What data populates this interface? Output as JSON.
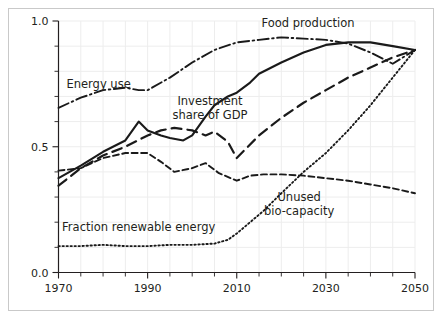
{
  "figure": {
    "background_color": "#ffffff",
    "frame_color": "#c9c9c9",
    "line_color": "#1a1a1a",
    "grid_color": "#ededed",
    "text_color": "#231f20"
  },
  "chart_data": {
    "type": "line",
    "title": "",
    "subtitle": "",
    "xlabel": "",
    "ylabel": "",
    "xlim": [
      1970,
      2050
    ],
    "ylim": [
      0.0,
      1.0
    ],
    "grid": true,
    "legend_position": "inline-annotations",
    "x_ticks_major": [
      1970,
      1990,
      2010,
      2030,
      2050
    ],
    "x_tick_labels": [
      "1970",
      "1990",
      "2010",
      "2030",
      "2050"
    ],
    "x_ticks_minor": [
      1975,
      1980,
      1985,
      1995,
      2000,
      2005,
      2015,
      2020,
      2025,
      2035,
      2040,
      2045
    ],
    "y_ticks_major": [
      0.0,
      0.5,
      1.0
    ],
    "y_tick_labels": [
      "0.0",
      "0.5",
      "1.0"
    ],
    "y_ticks_minor": [
      0.1,
      0.2,
      0.3,
      0.4,
      0.6,
      0.7,
      0.8,
      0.9
    ],
    "series": [
      {
        "name": "Food production",
        "label": "Food production",
        "style": "solid",
        "label_x": 2026,
        "label_y": 0.975,
        "x": [
          1970,
          1975,
          1980,
          1985,
          1988,
          1990,
          1993,
          1995,
          1998,
          2000,
          2003,
          2005,
          2008,
          2010,
          2013,
          2015,
          2020,
          2025,
          2030,
          2035,
          2040,
          2045,
          2050
        ],
        "values": [
          0.375,
          0.425,
          0.48,
          0.525,
          0.6,
          0.565,
          0.545,
          0.535,
          0.525,
          0.545,
          0.62,
          0.665,
          0.7,
          0.715,
          0.755,
          0.79,
          0.835,
          0.875,
          0.905,
          0.915,
          0.915,
          0.9,
          0.885
        ]
      },
      {
        "name": "Energy use",
        "label": "Energy use",
        "style": "dashdot",
        "label_x": 1979,
        "label_y": 0.735,
        "x": [
          1970,
          1975,
          1980,
          1985,
          1988,
          1990,
          1995,
          2000,
          2005,
          2010,
          2015,
          2020,
          2025,
          2030,
          2035,
          2040,
          2045,
          2050
        ],
        "values": [
          0.655,
          0.695,
          0.725,
          0.735,
          0.725,
          0.725,
          0.775,
          0.835,
          0.885,
          0.915,
          0.925,
          0.935,
          0.93,
          0.925,
          0.91,
          0.875,
          0.83,
          0.885
        ]
      },
      {
        "name": "Investment share of GDP",
        "label": "Investment\nshare of GDP",
        "label_line1": "Investment",
        "label_line2": "share of GDP",
        "style": "longdash",
        "label_x": 2004,
        "label_y": 0.665,
        "x": [
          1970,
          1975,
          1980,
          1985,
          1990,
          1993,
          1996,
          2000,
          2003,
          2005,
          2008,
          2010,
          2015,
          2020,
          2025,
          2030,
          2035,
          2040,
          2045,
          2050
        ],
        "values": [
          0.345,
          0.415,
          0.465,
          0.5,
          0.545,
          0.565,
          0.575,
          0.565,
          0.545,
          0.56,
          0.52,
          0.455,
          0.545,
          0.615,
          0.675,
          0.725,
          0.775,
          0.815,
          0.855,
          0.885
        ]
      },
      {
        "name": "Unused bio-capacity",
        "label": "Unused\nbio-capacity",
        "label_line1": "Unused",
        "label_line2": "bio-capacity",
        "style": "shortdash",
        "label_x": 2024,
        "label_y": 0.285,
        "x": [
          1970,
          1975,
          1980,
          1985,
          1990,
          1993,
          1996,
          2000,
          2003,
          2006,
          2010,
          2013,
          2016,
          2020,
          2025,
          2030,
          2035,
          2040,
          2045,
          2050
        ],
        "values": [
          0.405,
          0.415,
          0.455,
          0.475,
          0.475,
          0.44,
          0.4,
          0.415,
          0.435,
          0.395,
          0.365,
          0.385,
          0.39,
          0.39,
          0.385,
          0.375,
          0.365,
          0.35,
          0.335,
          0.315
        ]
      },
      {
        "name": "Fraction renewable energy",
        "label": "Fraction renewable energy",
        "style": "dotted",
        "label_x": 1988,
        "label_y": 0.165,
        "x": [
          1970,
          1975,
          1980,
          1985,
          1990,
          1995,
          2000,
          2005,
          2008,
          2010,
          2013,
          2016,
          2020,
          2025,
          2030,
          2035,
          2040,
          2045,
          2050
        ],
        "values": [
          0.105,
          0.105,
          0.11,
          0.105,
          0.105,
          0.11,
          0.11,
          0.115,
          0.13,
          0.155,
          0.2,
          0.245,
          0.315,
          0.4,
          0.475,
          0.565,
          0.665,
          0.775,
          0.885
        ]
      }
    ]
  }
}
